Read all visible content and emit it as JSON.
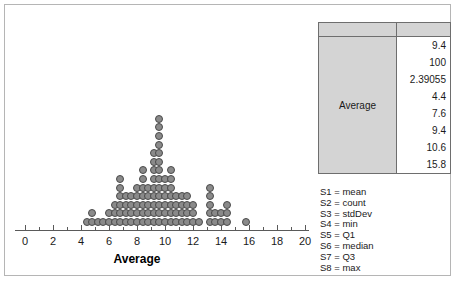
{
  "chart_data": {
    "type": "scatter",
    "plot_subtype": "dot-plot",
    "title": "",
    "xlabel": "Average",
    "ylabel": "",
    "xlim": [
      0,
      20
    ],
    "xticks": [
      0,
      2,
      4,
      6,
      8,
      10,
      12,
      14,
      16,
      18,
      20
    ],
    "xtick_labels": [
      "0",
      "2",
      "4",
      "6",
      "8",
      "10",
      "12",
      "14",
      "16",
      "18",
      "20"
    ],
    "minor_tick_step": 1,
    "grid": false,
    "legend_position": "right",
    "marker_color": "#8a8a8a",
    "marker_edge_color": "#4a4a4a",
    "n_points": 100,
    "bin_width": 0.4,
    "stacks": [
      {
        "x": 4.4,
        "count": 1
      },
      {
        "x": 4.8,
        "count": 2
      },
      {
        "x": 5.2,
        "count": 1
      },
      {
        "x": 5.6,
        "count": 1
      },
      {
        "x": 6.0,
        "count": 2
      },
      {
        "x": 6.4,
        "count": 3
      },
      {
        "x": 6.8,
        "count": 6
      },
      {
        "x": 7.2,
        "count": 4
      },
      {
        "x": 7.6,
        "count": 4
      },
      {
        "x": 8.0,
        "count": 5
      },
      {
        "x": 8.4,
        "count": 7
      },
      {
        "x": 8.8,
        "count": 5
      },
      {
        "x": 9.2,
        "count": 9
      },
      {
        "x": 9.6,
        "count": 13
      },
      {
        "x": 10.0,
        "count": 6
      },
      {
        "x": 10.4,
        "count": 7
      },
      {
        "x": 10.8,
        "count": 4
      },
      {
        "x": 11.2,
        "count": 4
      },
      {
        "x": 11.6,
        "count": 4
      },
      {
        "x": 12.0,
        "count": 3
      },
      {
        "x": 12.4,
        "count": 1
      },
      {
        "x": 13.2,
        "count": 5
      },
      {
        "x": 13.6,
        "count": 2
      },
      {
        "x": 14.0,
        "count": 2
      },
      {
        "x": 14.4,
        "count": 3
      },
      {
        "x": 15.8,
        "count": 1
      }
    ]
  },
  "summary_table": {
    "header": [
      "",
      ""
    ],
    "row_label": "Average",
    "stats": [
      {
        "key": "S1",
        "name": "mean",
        "value": "9.4"
      },
      {
        "key": "S2",
        "name": "count",
        "value": "100"
      },
      {
        "key": "S3",
        "name": "stdDev",
        "value": "2.39055"
      },
      {
        "key": "S4",
        "name": "min",
        "value": "4.4"
      },
      {
        "key": "S5",
        "name": "Q1",
        "value": "7.6"
      },
      {
        "key": "S6",
        "name": "median",
        "value": "9.4"
      },
      {
        "key": "S7",
        "name": "Q3",
        "value": "10.6"
      },
      {
        "key": "S8",
        "name": "max",
        "value": "15.8"
      }
    ]
  },
  "legend": {
    "entries": [
      {
        "text": "S1 = mean"
      },
      {
        "text": "S2 = count"
      },
      {
        "text": "S3 = stdDev"
      },
      {
        "text": "S4 = min"
      },
      {
        "text": "S5 = Q1"
      },
      {
        "text": "S6 = median"
      },
      {
        "text": "S7 = Q3"
      },
      {
        "text": "S8 = max"
      }
    ]
  },
  "colors": {
    "frame": "#b5b5b5",
    "marker": "#8a8a8a",
    "marker_edge": "#4a4a4a",
    "table_header_fill": "#d4d4d4",
    "table_border": "#6e6e6e",
    "axis": "#5a5a5a"
  }
}
